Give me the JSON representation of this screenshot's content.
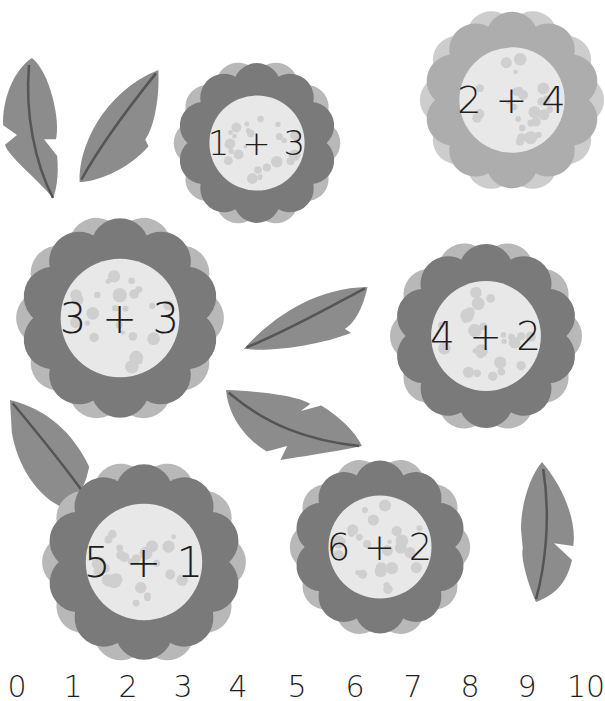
{
  "colors": {
    "background": "#ffffff",
    "petal_dark": "#7a7a7a",
    "petal_light": "#b8b8b8",
    "center": "#e8e8e8",
    "dots": "#cfcfcf",
    "leaf": "#8c8c8c",
    "leaf_vein": "#555555",
    "text": "#1e1e1e"
  },
  "flowers": [
    {
      "id": "f1",
      "expression": "1 + 3",
      "x": 172,
      "y": 58,
      "size": 170,
      "tone": "dark"
    },
    {
      "id": "f2",
      "expression": "2 + 4",
      "x": 418,
      "y": 6,
      "size": 188,
      "tone": "light"
    },
    {
      "id": "f3",
      "expression": "3 + 3",
      "x": 14,
      "y": 212,
      "size": 212,
      "tone": "dark"
    },
    {
      "id": "f4",
      "expression": "4 + 2",
      "x": 388,
      "y": 238,
      "size": 196,
      "tone": "dark"
    },
    {
      "id": "f5",
      "expression": "5 + 1",
      "x": 40,
      "y": 458,
      "size": 208,
      "tone": "dark"
    },
    {
      "id": "f6",
      "expression": "6 + 2",
      "x": 288,
      "y": 455,
      "size": 184,
      "tone": "dark"
    }
  ],
  "leaves": [
    {
      "id": "leaf-1",
      "x": 2,
      "y": 58,
      "w": 60,
      "h": 140,
      "rotate": 0,
      "notch": true
    },
    {
      "id": "leaf-2",
      "x": 78,
      "y": 70,
      "w": 82,
      "h": 112,
      "rotate": 0,
      "notch": false
    },
    {
      "id": "leaf-3",
      "x": 244,
      "y": 284,
      "w": 126,
      "h": 72,
      "rotate": 0,
      "notch": false
    },
    {
      "id": "leaf-4",
      "x": 226,
      "y": 390,
      "w": 136,
      "h": 70,
      "rotate": 0,
      "notch": true
    },
    {
      "id": "leaf-5",
      "x": 10,
      "y": 400,
      "w": 90,
      "h": 108,
      "rotate": 0,
      "notch": false
    },
    {
      "id": "leaf-6",
      "x": 518,
      "y": 462,
      "w": 60,
      "h": 140,
      "rotate": 0,
      "notch": true
    }
  ],
  "number_line": {
    "numbers": [
      "0",
      "1",
      "2",
      "3",
      "4",
      "5",
      "6",
      "7",
      "8",
      "9",
      "10"
    ],
    "positions": [
      17,
      73,
      128,
      183,
      238,
      297,
      355,
      413,
      470,
      527,
      586
    ]
  }
}
